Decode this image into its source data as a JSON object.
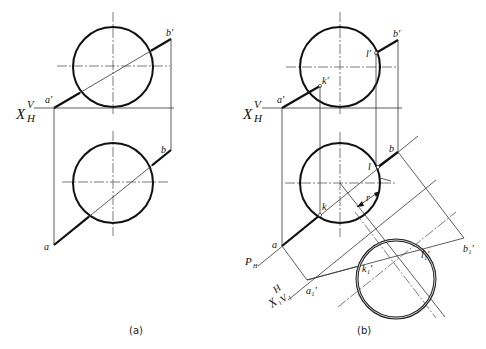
{
  "figures": [
    {
      "id": "a",
      "caption": "(a)",
      "axis_label": {
        "x": "X",
        "sup": "V",
        "sub": "H"
      },
      "points": {
        "a_prime": "a'",
        "b_prime": "b'",
        "a": "a",
        "b": "b"
      }
    },
    {
      "id": "b",
      "caption": "(b)",
      "axis_label": {
        "x": "X",
        "sup": "V",
        "sub": "H"
      },
      "aux_axis_label": {
        "x": "X",
        "sub1": "1",
        "h": "H",
        "v": "V",
        "vsub": "1"
      },
      "plane_label": {
        "p": "P",
        "sub": "H"
      },
      "radius_label": "r",
      "points": {
        "a_prime": "a'",
        "k_prime": "k'",
        "l_prime": "l'",
        "b_prime": "b'",
        "a": "a",
        "k": "k",
        "l": "l",
        "b": "b",
        "a1_prime": "a₁'",
        "k1_prime": "k₁'",
        "l1_prime": "l₁'",
        "b1_prime": "b₁'"
      }
    }
  ]
}
